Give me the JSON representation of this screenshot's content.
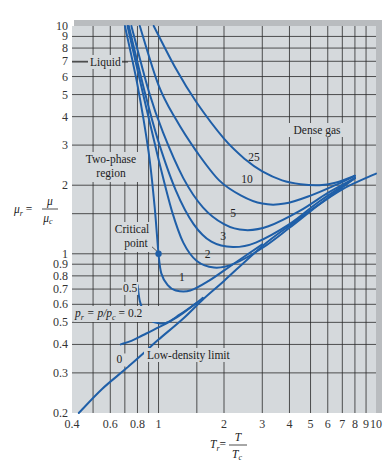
{
  "chart_data": {
    "type": "line",
    "title": "",
    "xlabel": "T_r = T / T_c",
    "ylabel": "μ_r = μ / μ_c",
    "xscale": "log",
    "yscale": "log",
    "xlim": [
      0.4,
      10
    ],
    "ylim": [
      0.2,
      10
    ],
    "grid": true,
    "legend": "none (curves labeled inline by reduced pressure p_r)",
    "x_ticks": [
      0.4,
      0.6,
      0.8,
      1,
      2,
      3,
      4,
      5,
      6,
      7,
      8,
      9,
      10
    ],
    "x_tick_labels": [
      "0.4",
      "0.6",
      "0.8",
      "1",
      "2",
      "3",
      "4",
      "5",
      "6",
      "7",
      "8",
      "9",
      "10"
    ],
    "x_grid": [
      0.5,
      0.6,
      0.7,
      0.8,
      0.9,
      1,
      1.5,
      2,
      3,
      4,
      5,
      6,
      7,
      8,
      9
    ],
    "y_ticks": [
      0.2,
      0.3,
      0.4,
      0.5,
      0.6,
      0.7,
      0.8,
      0.9,
      1,
      2,
      3,
      4,
      5,
      6,
      7,
      8,
      9,
      10
    ],
    "y_tick_labels": [
      "0.2",
      "0.3",
      "0.4",
      "0.5",
      "0.6",
      "0.7",
      "0.8",
      "0.9",
      "1",
      "2",
      "3",
      "4",
      "5",
      "6",
      "7",
      "8",
      "9",
      "10"
    ],
    "y_grid": [
      0.3,
      0.4,
      0.5,
      0.6,
      0.7,
      0.8,
      0.9,
      1,
      1.5,
      2,
      3,
      4,
      5,
      6,
      7,
      8,
      9
    ],
    "series": [
      {
        "name": "0",
        "label_at": [
          0.66,
          0.33
        ],
        "points": [
          [
            0.43,
            0.2
          ],
          [
            0.55,
            0.255
          ],
          [
            0.7,
            0.31
          ],
          [
            0.85,
            0.365
          ],
          [
            1,
            0.42
          ],
          [
            1.3,
            0.52
          ],
          [
            1.6,
            0.63
          ],
          [
            2,
            0.76
          ],
          [
            3,
            1.08
          ],
          [
            4,
            1.33
          ],
          [
            5,
            1.55
          ],
          [
            7,
            1.92
          ],
          [
            10,
            2.25
          ]
        ]
      },
      {
        "name": "p_r = p/p_c = 0.2",
        "label_at": [
          0.4,
          0.415
        ],
        "points": [
          [
            0.67,
            0.4
          ],
          [
            0.75,
            0.415
          ],
          [
            0.85,
            0.44
          ],
          [
            1,
            0.475
          ],
          [
            1.15,
            0.51
          ],
          [
            1.3,
            0.55
          ],
          [
            1.6,
            0.64
          ]
        ]
      },
      {
        "name": "0.5",
        "label_at": [
          0.74,
          0.68
        ],
        "points": [
          [
            0.8,
            0.73
          ],
          [
            0.82,
            0.62
          ],
          [
            0.86,
            0.55
          ],
          [
            0.92,
            0.51
          ],
          [
            1,
            0.495
          ],
          [
            1.1,
            0.5
          ],
          [
            1.25,
            0.54
          ],
          [
            1.5,
            0.61
          ]
        ]
      },
      {
        "name": "1",
        "label_at": [
          1.28,
          0.76
        ],
        "points": [
          [
            0.7,
            10
          ],
          [
            0.8,
            5.5
          ],
          [
            0.9,
            2.8
          ],
          [
            0.96,
            1.6
          ],
          [
            1,
            1.0
          ],
          [
            1.03,
            0.82
          ],
          [
            1.1,
            0.73
          ],
          [
            1.2,
            0.69
          ],
          [
            1.4,
            0.69
          ],
          [
            1.7,
            0.76
          ],
          [
            2.2,
            0.9
          ],
          [
            3,
            1.1
          ]
        ]
      },
      {
        "name": "2",
        "label_at": [
          1.68,
          0.96
        ],
        "points": [
          [
            0.72,
            10
          ],
          [
            0.85,
            5.0
          ],
          [
            1,
            2.6
          ],
          [
            1.15,
            1.55
          ],
          [
            1.3,
            1.12
          ],
          [
            1.5,
            0.93
          ],
          [
            1.8,
            0.87
          ],
          [
            2.2,
            0.9
          ],
          [
            3,
            1.06
          ],
          [
            4,
            1.3
          ],
          [
            5.5,
            1.65
          ],
          [
            8,
            2.15
          ]
        ]
      },
      {
        "name": "3",
        "label_at": [
          1.98,
          1.15
        ],
        "points": [
          [
            0.73,
            10
          ],
          [
            0.87,
            5.0
          ],
          [
            1,
            3.1
          ],
          [
            1.2,
            1.9
          ],
          [
            1.45,
            1.35
          ],
          [
            1.75,
            1.13
          ],
          [
            2.2,
            1.07
          ],
          [
            2.8,
            1.12
          ],
          [
            4,
            1.35
          ],
          [
            5.5,
            1.7
          ],
          [
            8,
            2.15
          ]
        ]
      },
      {
        "name": "5",
        "label_at": [
          2.2,
          1.45
        ],
        "points": [
          [
            0.75,
            10
          ],
          [
            0.9,
            5.2
          ],
          [
            1.05,
            3.4
          ],
          [
            1.3,
            2.15
          ],
          [
            1.6,
            1.6
          ],
          [
            2,
            1.35
          ],
          [
            2.5,
            1.27
          ],
          [
            3.2,
            1.32
          ],
          [
            4.5,
            1.55
          ],
          [
            6,
            1.85
          ],
          [
            8,
            2.15
          ]
        ]
      },
      {
        "name": "10",
        "label_at": [
          2.55,
          2.05
        ],
        "points": [
          [
            0.82,
            10
          ],
          [
            1,
            5.5
          ],
          [
            1.2,
            3.9
          ],
          [
            1.5,
            2.8
          ],
          [
            1.9,
            2.1
          ],
          [
            2.4,
            1.8
          ],
          [
            3,
            1.66
          ],
          [
            3.8,
            1.66
          ],
          [
            5,
            1.8
          ],
          [
            6.5,
            2.0
          ],
          [
            8,
            2.2
          ]
        ]
      },
      {
        "name": "25",
        "label_at": [
          2.75,
          2.55
        ],
        "points": [
          [
            0.95,
            10
          ],
          [
            1.2,
            6.5
          ],
          [
            1.5,
            4.6
          ],
          [
            2,
            3.2
          ],
          [
            2.5,
            2.6
          ],
          [
            3,
            2.3
          ],
          [
            3.7,
            2.1
          ],
          [
            4.5,
            2.02
          ],
          [
            5.5,
            2.0
          ],
          [
            6.5,
            2.05
          ],
          [
            8,
            2.2
          ]
        ]
      }
    ],
    "annotations": [
      {
        "text": "Liquid",
        "at": [
          0.52,
          7
        ]
      },
      {
        "text": "Two-phase region",
        "at": [
          0.52,
          2.6
        ]
      },
      {
        "text": "Dense gas",
        "at": [
          4.3,
          3.7
        ]
      },
      {
        "text": "Critical point",
        "at": [
          0.9,
          1.35
        ],
        "points_to": [
          1.0,
          1.0
        ]
      },
      {
        "text": "Low-density limit",
        "at": [
          1.6,
          0.37
        ]
      }
    ],
    "critical_point": [
      1.0,
      1.0
    ],
    "colors": {
      "curve": "#1f5fa8",
      "background": "#d5d9dc",
      "grid": "#2a2a2a",
      "frame": "#b9bcbf"
    }
  },
  "labels": {
    "y_axis": {
      "main": "μ",
      "sub": "r",
      "num": "μ",
      "den_main": "μ",
      "den_sub": "c"
    },
    "x_axis": {
      "main": "T",
      "sub": "r",
      "num": "T",
      "den_main": "T",
      "den_sub": "c"
    },
    "liquid": "Liquid",
    "two_phase_1": "Two-phase",
    "two_phase_2": "region",
    "dense_gas": "Dense gas",
    "critical_1": "Critical",
    "critical_2": "point",
    "low_density": "Low-density limit",
    "pr_label_prefix": "p",
    "pr_label_sub": "r",
    "pr_label_mid": " = p/p",
    "pr_label_sub2": "c",
    "pr_label_val": " = 0.2"
  }
}
